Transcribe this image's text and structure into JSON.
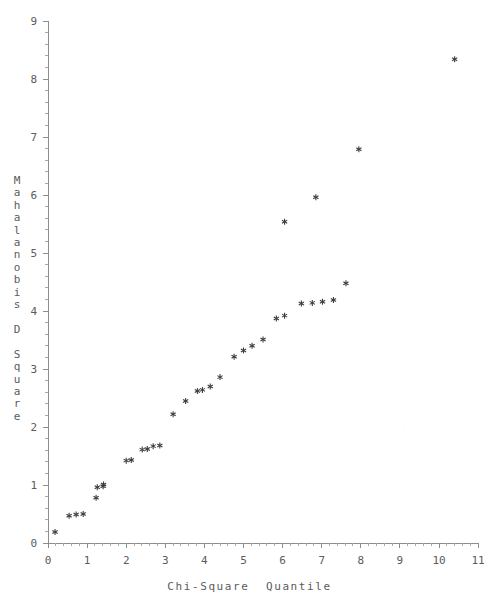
{
  "chart_data": {
    "type": "scatter",
    "title": "",
    "xlabel": "Chi-Square Quantile",
    "ylabel": "Mahalanobis D Square",
    "xlim": [
      0,
      11
    ],
    "ylim": [
      0,
      9
    ],
    "xticks": [
      0,
      1,
      2,
      3,
      4,
      5,
      6,
      7,
      8,
      9,
      10,
      11
    ],
    "yticks": [
      0,
      1,
      2,
      3,
      4,
      5,
      6,
      7,
      8,
      9
    ],
    "xtick_labels": [
      "0",
      "1",
      "2",
      "3",
      "4",
      "5",
      "6",
      "7",
      "8",
      "9",
      "10",
      "11"
    ],
    "ytick_labels": [
      "0",
      "1",
      "2",
      "3",
      "4",
      "5",
      "6",
      "7",
      "8",
      "9"
    ],
    "minor_ticks_per_major_x": 5,
    "minor_ticks_per_major_y": 5,
    "grid": false,
    "legend": null,
    "marker": "asterisk",
    "marker_color": "#3d3d3d",
    "axis_color": "#8d8d8d",
    "background_color": "#ffffff",
    "series": [
      {
        "name": "Mahalanobis D Square vs Chi-Square Quantile",
        "points": [
          [
            0.18,
            0.19
          ],
          [
            0.54,
            0.47
          ],
          [
            0.72,
            0.49
          ],
          [
            0.9,
            0.5
          ],
          [
            1.23,
            0.78
          ],
          [
            1.26,
            0.96
          ],
          [
            1.41,
            0.98
          ],
          [
            1.42,
            1.01
          ],
          [
            2.0,
            1.42
          ],
          [
            2.13,
            1.43
          ],
          [
            2.41,
            1.61
          ],
          [
            2.54,
            1.62
          ],
          [
            2.69,
            1.67
          ],
          [
            2.86,
            1.68
          ],
          [
            3.2,
            2.22
          ],
          [
            3.52,
            2.45
          ],
          [
            3.82,
            2.62
          ],
          [
            3.95,
            2.64
          ],
          [
            4.15,
            2.7
          ],
          [
            4.4,
            2.86
          ],
          [
            4.76,
            3.21
          ],
          [
            5.0,
            3.32
          ],
          [
            5.22,
            3.4
          ],
          [
            5.5,
            3.51
          ],
          [
            5.84,
            3.87
          ],
          [
            6.05,
            3.92
          ],
          [
            6.48,
            4.13
          ],
          [
            6.76,
            4.14
          ],
          [
            7.02,
            4.16
          ],
          [
            7.3,
            4.19
          ],
          [
            7.62,
            4.48
          ],
          [
            6.05,
            5.54
          ],
          [
            6.85,
            5.96
          ],
          [
            7.95,
            6.79
          ],
          [
            10.4,
            8.34
          ]
        ]
      }
    ],
    "note": "Points listed as [chi-square quantile, Mahalanobis D square]"
  },
  "axes": {
    "x": {
      "title": "Chi-Square Quantile",
      "title_spaced": "Chi-Square  Quantile"
    },
    "y": {
      "title": "Mahalanobis D Square",
      "letters": [
        "M",
        "a",
        "h",
        "a",
        "l",
        "a",
        "n",
        "o",
        "b",
        "i",
        "s",
        " ",
        "D",
        " ",
        "S",
        "q",
        "u",
        "a",
        "r",
        "e"
      ]
    }
  },
  "colors": {
    "marker": "#3d3d3d",
    "axis": "#8d8d8d",
    "tick_label": "#5b5b5b",
    "background": "#ffffff"
  }
}
